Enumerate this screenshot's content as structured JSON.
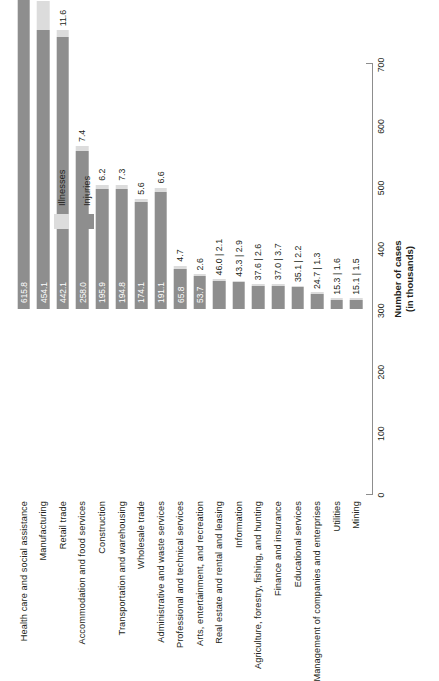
{
  "chart_data": {
    "type": "bar",
    "orientation": "horizontal",
    "stacked": true,
    "title": "",
    "xlabel": "Number of cases",
    "xlabel_sub": "(in thousands)",
    "ylabel": "",
    "xlim": [
      0,
      700
    ],
    "xticks": [
      "0",
      "100",
      "200",
      "300",
      "400",
      "500",
      "600",
      "700"
    ],
    "grid": false,
    "legend_position": "right",
    "categories": [
      "Health care and social assistance",
      "Manufacturing",
      "Retail trade",
      "Accommodation and food services",
      "Construction",
      "Transportation and warehousing",
      "Wholesale trade",
      "Administrative and waste services",
      "Professional and technical services",
      "Arts, entertainment, and recreation",
      "Real estate and rental and leasing",
      "Information",
      "Agriculture, forestry, fishing, and hunting",
      "Finance and insurance",
      "Educational services",
      "Management of companies and enterprises",
      "Utilities",
      "Mining"
    ],
    "series": [
      {
        "name": "Injuries",
        "color": "#8e8e8e",
        "values": [
          615.8,
          454.1,
          442.1,
          258.0,
          195.9,
          194.8,
          174.1,
          191.1,
          65.8,
          53.7,
          46.0,
          43.3,
          37.6,
          37.0,
          35.1,
          24.7,
          15.3,
          15.1
        ]
      },
      {
        "name": "Illnesses",
        "color": "#dcdcdc",
        "values": [
          38.1,
          47.7,
          11.6,
          7.4,
          6.2,
          7.3,
          5.6,
          6.6,
          4.7,
          2.6,
          2.1,
          2.9,
          2.6,
          3.7,
          2.2,
          1.3,
          1.6,
          1.5
        ]
      }
    ],
    "bar_labels": [
      {
        "injuries": "615.8",
        "illnesses": "38.1",
        "style": "split"
      },
      {
        "injuries": "454.1",
        "illnesses": "47.7",
        "style": "split"
      },
      {
        "injuries": "442.1",
        "illnesses": "11.6",
        "style": "split"
      },
      {
        "injuries": "258.0",
        "illnesses": "7.4",
        "style": "split"
      },
      {
        "injuries": "195.9",
        "illnesses": "6.2",
        "style": "split"
      },
      {
        "injuries": "194.8",
        "illnesses": "7.3",
        "style": "split"
      },
      {
        "injuries": "174.1",
        "illnesses": "5.6",
        "style": "split"
      },
      {
        "injuries": "191.1",
        "illnesses": "6.6",
        "style": "split"
      },
      {
        "injuries": "65.8",
        "illnesses": "4.7",
        "style": "split"
      },
      {
        "injuries": "53.7",
        "illnesses": "2.6",
        "style": "split"
      },
      {
        "injuries": "46.0",
        "illnesses": "2.1",
        "style": "pair",
        "pair_text": "46.0 | 2.1"
      },
      {
        "injuries": "43.3",
        "illnesses": "2.9",
        "style": "pair",
        "pair_text": "43.3 | 2.9"
      },
      {
        "injuries": "37.6",
        "illnesses": "2.6",
        "style": "pair",
        "pair_text": "37.6 | 2.6"
      },
      {
        "injuries": "37.0",
        "illnesses": "3.7",
        "style": "pair",
        "pair_text": "37.0 | 3.7"
      },
      {
        "injuries": "35.1",
        "illnesses": "2.2",
        "style": "pair",
        "pair_text": "35.1 | 2.2"
      },
      {
        "injuries": "24.7",
        "illnesses": "1.3",
        "style": "pair",
        "pair_text": "24.7 | 1.3"
      },
      {
        "injuries": "15.3",
        "illnesses": "1.6",
        "style": "pair",
        "pair_text": "15.3 | 1.6"
      },
      {
        "injuries": "15.1",
        "illnesses": "1.5",
        "style": "pair",
        "pair_text": "15.1 | 1.5"
      }
    ]
  },
  "legend": {
    "items": [
      {
        "label": "Illnesses",
        "color": "#dcdcdc",
        "key": "ill"
      },
      {
        "label": "Injuries",
        "color": "#8e8e8e",
        "key": "inj"
      }
    ]
  },
  "axis": {
    "title_line1": "Number of cases",
    "title_line2": "(in thousands)"
  }
}
